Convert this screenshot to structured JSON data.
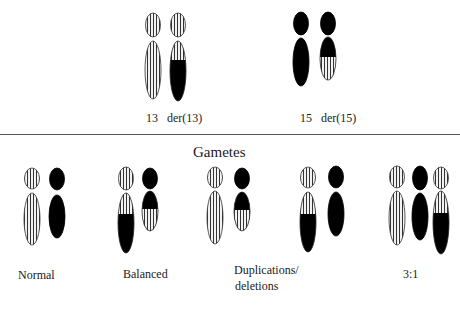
{
  "top_labels": {
    "chr13": "13",
    "der13": "der(13)",
    "chr15": "15",
    "der15": "der(15)"
  },
  "section_title": "Gametes",
  "gamete_labels": {
    "normal": "Normal",
    "balanced": "Balanced",
    "dup_del_line1": "Duplications/",
    "dup_del_line2": "deletions",
    "three_one": "3:1"
  },
  "patterns": {
    "striped": "vertical-stripes",
    "solid": "black"
  },
  "colors": {
    "stripe_fg": "#333333",
    "stripe_bg": "#f2f2f2",
    "solid": "#000000"
  },
  "chromosomes": {
    "top": [
      {
        "id": "chr13",
        "type": "13"
      },
      {
        "id": "der13",
        "type": "der13"
      },
      {
        "id": "chr15",
        "type": "15"
      },
      {
        "id": "der15",
        "type": "der15"
      }
    ],
    "gametes": [
      {
        "group": "normal",
        "members": [
          "13",
          "15"
        ]
      },
      {
        "group": "balanced",
        "members": [
          "der13",
          "der15"
        ]
      },
      {
        "group": "dup-del-1",
        "members": [
          "13",
          "der15"
        ]
      },
      {
        "group": "dup-del-2",
        "members": [
          "der13",
          "15"
        ]
      },
      {
        "group": "three-one",
        "members": [
          "13",
          "15",
          "der13"
        ]
      }
    ]
  }
}
